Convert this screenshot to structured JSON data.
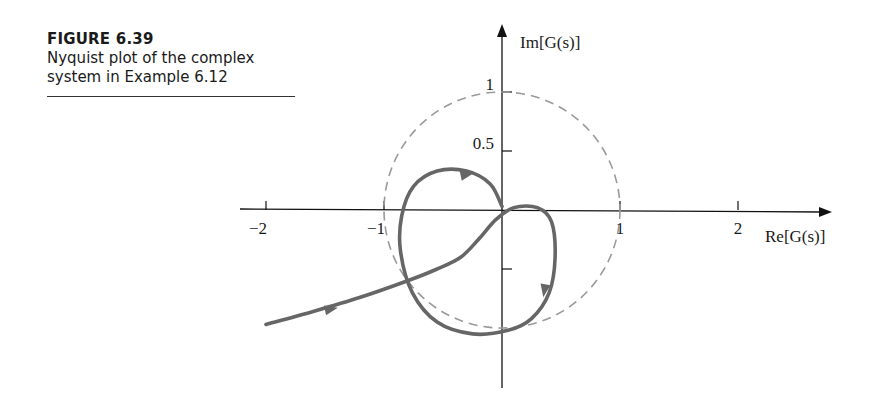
{
  "caption": {
    "figure_label": "FIGURE 6.39",
    "description": "Nyquist plot of the complex system in Example 6.12"
  },
  "chart_data": {
    "type": "line",
    "title": "Nyquist plot of the complex system in Example 6.12",
    "xlabel": "Re[G(s)]",
    "ylabel": "Im[G(s)]",
    "x_ticks": [
      -2,
      -1,
      1,
      2
    ],
    "x_tick_labels": [
      "−2",
      "−1",
      "1",
      "2"
    ],
    "y_ticks": [
      1,
      0.5,
      -0.5
    ],
    "y_tick_labels": [
      "1",
      "0.5",
      ""
    ],
    "xlim": [
      -2.2,
      2.8
    ],
    "ylim": [
      -1.6,
      1.7
    ],
    "grid": false,
    "legend": null,
    "reference_circle": {
      "center": [
        0,
        0
      ],
      "radius": 1,
      "style": "dashed",
      "color": "#999999"
    },
    "series": [
      {
        "name": "Nyquist curve",
        "color": "#666666",
        "x": [
          -2.0,
          -1.6,
          -1.2,
          -0.8,
          -0.55,
          -0.35,
          -0.2,
          -0.05,
          0.1,
          0.3,
          0.42,
          0.45,
          0.4,
          0.25,
          0.05,
          -0.25,
          -0.55,
          -0.76,
          -0.86,
          -0.85,
          -0.75,
          -0.55,
          -0.3,
          -0.1,
          0.0
        ],
        "y": [
          -0.97,
          -0.86,
          -0.74,
          -0.6,
          -0.5,
          -0.4,
          -0.25,
          -0.08,
          0.02,
          0.02,
          -0.1,
          -0.4,
          -0.7,
          -0.92,
          -1.02,
          -1.05,
          -0.95,
          -0.7,
          -0.35,
          -0.05,
          0.2,
          0.33,
          0.33,
          0.22,
          0.03
        ]
      }
    ],
    "arrows": [
      {
        "at": [
          -1.45,
          -0.84
        ],
        "direction": "right"
      },
      {
        "at": [
          0.36,
          -0.68
        ],
        "direction": "down"
      },
      {
        "at": [
          -0.3,
          0.3
        ],
        "direction": "right"
      }
    ]
  }
}
